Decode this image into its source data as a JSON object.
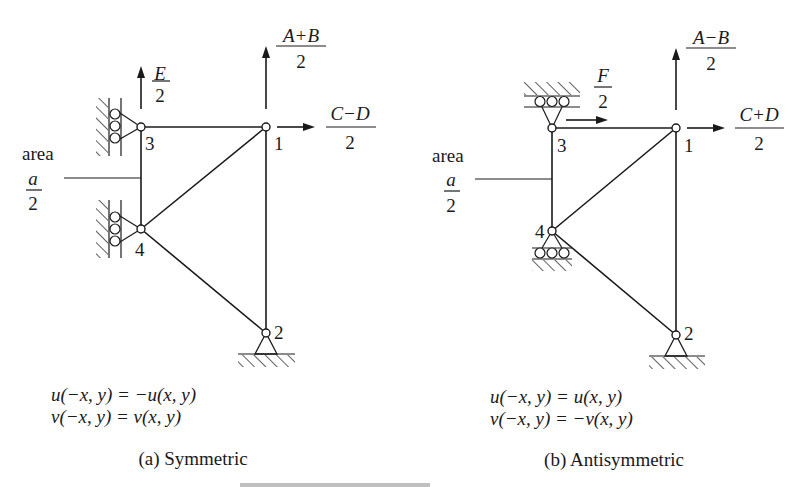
{
  "figure": {
    "panels": [
      {
        "id": "symmetric",
        "caption": "(a) Symmetric",
        "area_label": "area",
        "area_fraction": {
          "numerator": "a",
          "denominator": "2"
        },
        "nodes": [
          {
            "label": "1"
          },
          {
            "label": "2"
          },
          {
            "label": "3"
          },
          {
            "label": "4"
          }
        ],
        "loads": {
          "node3_vertical": {
            "numerator": "E",
            "denominator": "2"
          },
          "node1_vertical": {
            "numerator": "A+B",
            "denominator": "2"
          },
          "node1_horizontal": {
            "numerator": "C−D",
            "denominator": "2"
          }
        },
        "equations": [
          "u(−x, y) = −u(x, y)",
          "v(−x, y) = v(x, y)"
        ]
      },
      {
        "id": "antisymmetric",
        "caption": "(b) Antisymmetric",
        "area_label": "area",
        "area_fraction": {
          "numerator": "a",
          "denominator": "2"
        },
        "nodes": [
          {
            "label": "1"
          },
          {
            "label": "2"
          },
          {
            "label": "3"
          },
          {
            "label": "4"
          }
        ],
        "loads": {
          "node3_horizontal": {
            "numerator": "F",
            "denominator": "2"
          },
          "node1_vertical": {
            "numerator": "A−B",
            "denominator": "2"
          },
          "node1_horizontal": {
            "numerator": "C+D",
            "denominator": "2"
          }
        },
        "equations": [
          "u(−x, y) = u(x, y)",
          "v(−x, y) = −v(x, y)"
        ]
      }
    ]
  }
}
